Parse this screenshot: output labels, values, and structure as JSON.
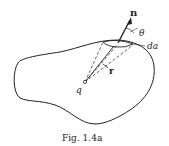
{
  "diagram": {
    "labels": {
      "normal": "n",
      "angle": "θ",
      "area": "da",
      "radius": "r",
      "charge": "q"
    },
    "caption": "Fig. 1.4a"
  },
  "colors": {
    "ink": "#222222",
    "background": "#ffffff"
  }
}
